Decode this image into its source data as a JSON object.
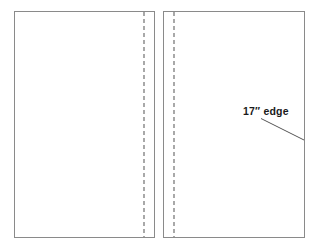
{
  "figure": {
    "kind": "fabric-fold-diagram",
    "background_color": "#ffffff",
    "panel_fill": "#ffffff",
    "outline_color": "#8a8a8a",
    "fold_line_color": "#707070",
    "leader_line_color": "#555555",
    "text_color": "#1a1a1a"
  },
  "panels": [
    {
      "id": "left-panel",
      "label": "left fabric panel",
      "x": 14.5,
      "y": 11.5,
      "width": 140,
      "height": 226,
      "fold_line": {
        "label": "left panel fold line",
        "x": 144,
        "y_top": 12,
        "y_bottom": 237,
        "dash": "4 3"
      }
    },
    {
      "id": "right-panel",
      "label": "right fabric panel",
      "x": 163.5,
      "y": 11.5,
      "width": 141,
      "height": 226,
      "fold_line": {
        "label": "right panel fold line",
        "x": 174,
        "y_top": 12,
        "y_bottom": 237,
        "dash": "4 3"
      }
    }
  ],
  "annotations": [
    {
      "id": "edge-callout",
      "text": "17″ edge",
      "text_x": 243,
      "text_y": 115,
      "leader": {
        "label": "callout leader line",
        "x1": 261,
        "y1": 118.5,
        "x2": 304,
        "y2": 140
      }
    }
  ]
}
